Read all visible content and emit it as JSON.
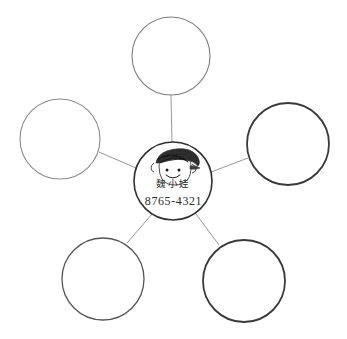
{
  "diagram": {
    "type": "bubble-map",
    "background_color": "#ffffff",
    "center": {
      "name_text": "魏小娃",
      "phone_text": "8765-4321",
      "avatar_icon": "child-face-sketch-icon",
      "cx": 173,
      "cy": 181,
      "r": 39,
      "stroke_color": "#2f2f2f",
      "stroke_width": 1.6
    },
    "satellites": [
      {
        "label": "",
        "position": "top",
        "cx": 171,
        "cy": 56,
        "r": 39,
        "stroke_color": "#7d7d7d",
        "stroke_width": 1.1
      },
      {
        "label": "",
        "position": "left",
        "cx": 60,
        "cy": 139,
        "r": 40,
        "stroke_color": "#8a8a8a",
        "stroke_width": 1.1
      },
      {
        "label": "",
        "position": "right",
        "cx": 288,
        "cy": 144,
        "r": 41,
        "stroke_color": "#3a3a3a",
        "stroke_width": 1.8
      },
      {
        "label": "",
        "position": "bottom-left",
        "cx": 103,
        "cy": 279,
        "r": 41,
        "stroke_color": "#555555",
        "stroke_width": 1.3
      },
      {
        "label": "",
        "position": "bottom-right",
        "cx": 244,
        "cy": 281,
        "r": 41,
        "stroke_color": "#3a3a3a",
        "stroke_width": 1.8
      }
    ],
    "connectors": {
      "stroke_color": "#8c8c8c",
      "stroke_width": 0.9
    }
  }
}
